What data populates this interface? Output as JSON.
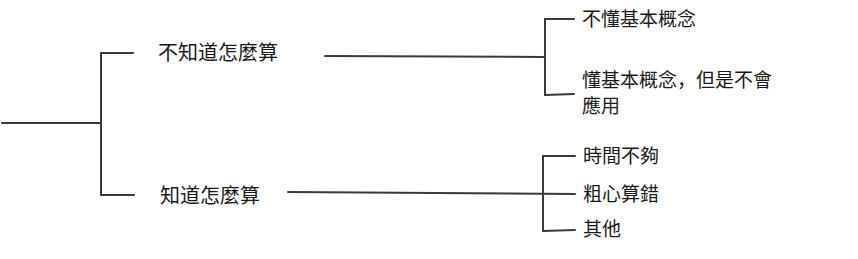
{
  "diagram": {
    "type": "tree",
    "root": {
      "label": "",
      "children": [
        {
          "label": "不知道怎麼算",
          "children": [
            {
              "label": "不懂基本概念"
            },
            {
              "label": "懂基本概念，但是不會應用",
              "line1": "懂基本概念，但是不會",
              "line2": "應用"
            }
          ]
        },
        {
          "label": "知道怎麼算",
          "children": [
            {
              "label": "時間不夠"
            },
            {
              "label": "粗心算錯"
            },
            {
              "label": "其他"
            }
          ]
        }
      ]
    },
    "line_color": "#3a3a3a"
  }
}
